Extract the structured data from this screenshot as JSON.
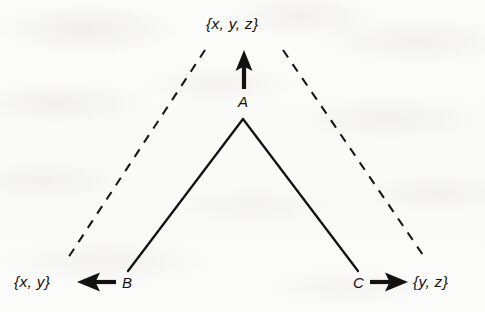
{
  "figure": {
    "type": "diagram",
    "background_color": "#fbfbfa",
    "ink_color": "#14120f",
    "nodes": [
      {
        "id": "A",
        "label": "A",
        "x": 243,
        "y": 100
      },
      {
        "id": "B",
        "label": "B",
        "x": 128,
        "y": 283
      },
      {
        "id": "C",
        "label": "C",
        "x": 358,
        "y": 283
      }
    ],
    "set_labels": [
      {
        "id": "top",
        "text": "{x, y, z}",
        "x": 246,
        "y": 24,
        "from_node": "A"
      },
      {
        "id": "left",
        "text": "{x, y}",
        "x": 40,
        "y": 283,
        "from_node": "B"
      },
      {
        "id": "right",
        "text": "{y, z}",
        "x": 440,
        "y": 283,
        "from_node": "C"
      }
    ],
    "arrows": [
      {
        "id": "a-to-top",
        "direction": "up",
        "from": "A",
        "to": "{x, y, z}"
      },
      {
        "id": "b-to-left",
        "direction": "left",
        "from": "B",
        "to": "{x, y}"
      },
      {
        "id": "c-to-right",
        "direction": "right",
        "from": "C",
        "to": "{y, z}"
      }
    ],
    "solid_edges": [
      {
        "id": "a-b",
        "from": "A",
        "to": "B"
      },
      {
        "id": "a-c",
        "from": "A",
        "to": "C"
      }
    ],
    "dashed_edges": [
      {
        "id": "cone-left",
        "from_x": 205,
        "from_y": 50,
        "to_x": 68,
        "to_y": 258
      },
      {
        "id": "cone-right",
        "from_x": 283,
        "from_y": 50,
        "to_x": 425,
        "to_y": 258
      }
    ]
  }
}
